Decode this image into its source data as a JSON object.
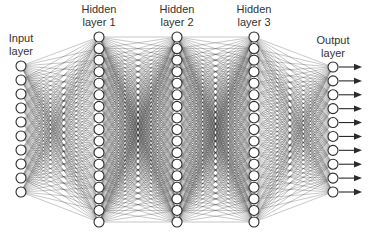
{
  "diagram": {
    "colors": {
      "line": "#2b2b2b",
      "node_fill": "#ffffff",
      "label": "#333333",
      "background": "#ffffff"
    },
    "node_radius": 5,
    "layers": [
      {
        "id": "input",
        "label_line1": "Input",
        "label_line2": "layer",
        "x": 21,
        "nodes": 10,
        "y_start": 66,
        "y_end": 192,
        "label_top": 32
      },
      {
        "id": "hidden1",
        "label_line1": "Hidden",
        "label_line2": "layer 1",
        "x": 99,
        "nodes": 17,
        "y_start": 37,
        "y_end": 222,
        "label_top": 3
      },
      {
        "id": "hidden2",
        "label_line1": "Hidden",
        "label_line2": "layer 2",
        "x": 177,
        "nodes": 17,
        "y_start": 37,
        "y_end": 222,
        "label_top": 3
      },
      {
        "id": "hidden3",
        "label_line1": "Hidden",
        "label_line2": "layer 3",
        "x": 254,
        "nodes": 17,
        "y_start": 37,
        "y_end": 222,
        "label_top": 3
      },
      {
        "id": "output",
        "label_line1": "Output",
        "label_line2": "layer",
        "x": 333,
        "nodes": 10,
        "y_start": 67,
        "y_end": 192,
        "label_top": 34
      }
    ],
    "output_arrows": {
      "start_offset": 6,
      "end_x": 362
    }
  }
}
